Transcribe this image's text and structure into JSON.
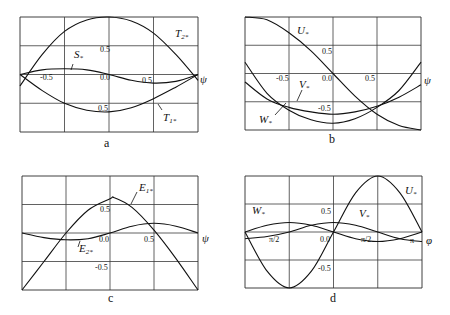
{
  "chart_data": [
    {
      "type": "line",
      "panel": "a",
      "caption": "a",
      "xlabel": "ψ",
      "xlim": [
        -1.0,
        1.0
      ],
      "ylim": [
        -1.0,
        1.0
      ],
      "grid": true,
      "tick_labels": [
        "-0.5",
        "0.0",
        "0.5",
        "0.5",
        "0.5"
      ],
      "series": [
        {
          "name": "T2*",
          "x": [
            -1.0,
            -0.75,
            -0.5,
            -0.25,
            0.0,
            0.25,
            0.5,
            0.75,
            1.0
          ],
          "y": [
            -0.2,
            0.35,
            0.75,
            0.95,
            1.0,
            0.93,
            0.72,
            0.35,
            -0.1
          ]
        },
        {
          "name": "S*",
          "x": [
            -1.0,
            -0.75,
            -0.5,
            -0.25,
            0.0,
            0.25,
            0.5,
            0.75,
            1.0
          ],
          "y": [
            0.0,
            0.08,
            0.1,
            0.08,
            0.0,
            -0.1,
            -0.15,
            -0.12,
            0.0
          ]
        },
        {
          "name": "T1*",
          "x": [
            -1.0,
            -0.75,
            -0.5,
            -0.25,
            0.0,
            0.25,
            0.5,
            0.75,
            1.0
          ],
          "y": [
            0.0,
            -0.28,
            -0.5,
            -0.62,
            -0.65,
            -0.58,
            -0.42,
            -0.22,
            0.0
          ]
        }
      ]
    },
    {
      "type": "line",
      "panel": "b",
      "caption": "b",
      "xlabel": "ψ",
      "xlim": [
        -1.0,
        1.0
      ],
      "ylim": [
        -1.0,
        1.0
      ],
      "grid": true,
      "tick_labels": [
        "-0.5",
        "0.0",
        "0.5",
        "0.5",
        "-0.5"
      ],
      "series": [
        {
          "name": "U*",
          "x": [
            -1.0,
            -0.75,
            -0.5,
            -0.25,
            0.0,
            0.25,
            0.5,
            0.75,
            1.0
          ],
          "y": [
            1.0,
            0.95,
            0.72,
            0.4,
            0.0,
            -0.4,
            -0.72,
            -0.92,
            -1.0
          ]
        },
        {
          "name": "V*",
          "x": [
            -1.0,
            -0.75,
            -0.5,
            -0.25,
            0.0,
            0.25,
            0.5,
            0.75,
            1.0
          ],
          "y": [
            -0.15,
            -0.45,
            -0.6,
            -0.68,
            -0.72,
            -0.68,
            -0.58,
            -0.42,
            -0.2
          ]
        },
        {
          "name": "W*",
          "x": [
            -1.0,
            -0.75,
            -0.5,
            -0.25,
            0.0,
            0.25,
            0.5,
            0.75,
            1.0
          ],
          "y": [
            0.2,
            -0.35,
            -0.65,
            -0.82,
            -0.88,
            -0.8,
            -0.6,
            -0.3,
            0.2
          ]
        }
      ]
    },
    {
      "type": "line",
      "panel": "c",
      "caption": "c",
      "xlabel": "ψ",
      "xlim": [
        -1.0,
        1.0
      ],
      "ylim": [
        -1.0,
        1.0
      ],
      "grid": true,
      "tick_labels": [
        "0.5",
        "0.0",
        "0.5",
        "-0.5"
      ],
      "series": [
        {
          "name": "E1*",
          "x": [
            -1.0,
            -0.75,
            -0.5,
            -0.25,
            0.0,
            0.05,
            0.25,
            0.5,
            0.75,
            1.0
          ],
          "y": [
            -1.0,
            -0.5,
            0.0,
            0.4,
            0.6,
            0.62,
            0.45,
            0.05,
            -0.45,
            -1.0
          ]
        },
        {
          "name": "E2*",
          "x": [
            -1.0,
            -0.75,
            -0.5,
            -0.25,
            0.0,
            0.25,
            0.5,
            0.75,
            1.0
          ],
          "y": [
            0.0,
            -0.08,
            -0.12,
            -0.1,
            0.0,
            0.12,
            0.17,
            0.12,
            0.0
          ]
        }
      ]
    },
    {
      "type": "line",
      "panel": "d",
      "caption": "d",
      "xlabel": "φ",
      "xlim": [
        -1.0,
        1.0
      ],
      "ylim": [
        -1.0,
        1.0
      ],
      "grid": true,
      "tick_labels": [
        "0.5",
        "0.0",
        "-0.5",
        "π/2",
        "π/2",
        "π"
      ],
      "series": [
        {
          "name": "U*",
          "x": [
            -1.0,
            -0.75,
            -0.5,
            -0.25,
            0.0,
            0.25,
            0.5,
            0.75,
            1.0
          ],
          "y": [
            0.0,
            -0.7,
            -1.0,
            -0.7,
            0.0,
            0.7,
            1.0,
            0.7,
            0.0
          ]
        },
        {
          "name": "V*",
          "x": [
            -1.0,
            -0.75,
            -0.5,
            -0.25,
            0.0,
            0.25,
            0.5,
            0.75,
            1.0
          ],
          "y": [
            -0.12,
            -0.08,
            0.0,
            0.12,
            0.17,
            0.12,
            0.0,
            -0.12,
            -0.17
          ]
        },
        {
          "name": "W*",
          "x": [
            -1.0,
            -0.75,
            -0.5,
            -0.25,
            0.0,
            0.25,
            0.5,
            0.75,
            1.0
          ],
          "y": [
            0.0,
            0.12,
            0.17,
            0.12,
            0.0,
            -0.12,
            -0.17,
            -0.12,
            0.0
          ]
        }
      ]
    }
  ],
  "labels": {
    "a": {
      "t2": "T",
      "t2sub": "2*",
      "s": "S",
      "ssub": "*",
      "t1": "T",
      "t1sub": "1*",
      "axis": "ψ",
      "caption": "a",
      "ticks": [
        "-0.5",
        "0.0",
        "0.5",
        "0.5",
        "0.5"
      ]
    },
    "b": {
      "u": "U",
      "usub": "*",
      "v": "V",
      "vsub": "*",
      "w": "W",
      "wsub": "*",
      "axis": "ψ",
      "caption": "b",
      "ticks": [
        "-0.5",
        "0.0",
        "0.5",
        "0.5",
        "-0.5"
      ]
    },
    "c": {
      "e1": "E",
      "e1sub": "1*",
      "e2": "E",
      "e2sub": "2*",
      "axis": "ψ",
      "caption": "c",
      "ticks": [
        "0.5",
        "0.0",
        "0.5",
        "-0.5"
      ]
    },
    "d": {
      "u": "U",
      "usub": "*",
      "v": "V",
      "vsub": "*",
      "w": "W",
      "wsub": "*",
      "axis": "φ",
      "caption": "d",
      "ticks": [
        "0.5",
        "0.0",
        "-0.5",
        "π/2",
        "π/2",
        "π"
      ]
    }
  }
}
